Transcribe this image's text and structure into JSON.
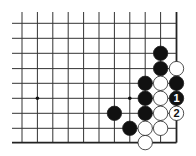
{
  "diagram": {
    "type": "go-board-corner",
    "view": "lower-right corner",
    "columns_x": [
      22,
      37.4,
      52.8,
      68.2,
      83.6,
      99,
      114.4,
      129.8,
      145.2,
      160.6,
      176.5
    ],
    "rows_y": [
      23.3,
      38.3,
      53.3,
      68.6,
      83.3,
      98.3,
      113.3,
      128.3,
      142.6
    ],
    "line_extent": {
      "left": 12,
      "top": 12,
      "right": 176.5,
      "bottom": 142.6
    },
    "edges": [
      "right",
      "bottom"
    ],
    "star_points": [
      {
        "col": 1,
        "row": 5
      },
      {
        "col": 7,
        "row": 5
      }
    ],
    "stones": [
      {
        "color": "black",
        "col": 9,
        "row": 2,
        "label": ""
      },
      {
        "color": "black",
        "col": 9,
        "row": 3,
        "label": ""
      },
      {
        "color": "white",
        "col": 10,
        "row": 3,
        "label": ""
      },
      {
        "color": "black",
        "col": 8,
        "row": 4,
        "label": ""
      },
      {
        "color": "white",
        "col": 9,
        "row": 4,
        "label": ""
      },
      {
        "color": "black",
        "col": 10,
        "row": 4,
        "label": ""
      },
      {
        "color": "black",
        "col": 8,
        "row": 5,
        "label": ""
      },
      {
        "color": "white",
        "col": 9,
        "row": 5,
        "label": ""
      },
      {
        "color": "black",
        "col": 10,
        "row": 5,
        "label": "1"
      },
      {
        "color": "black",
        "col": 6,
        "row": 6,
        "label": ""
      },
      {
        "color": "black",
        "col": 8,
        "row": 6,
        "label": ""
      },
      {
        "color": "white",
        "col": 9,
        "row": 6,
        "label": ""
      },
      {
        "color": "white",
        "col": 10,
        "row": 6,
        "label": "2"
      },
      {
        "color": "black",
        "col": 7,
        "row": 7,
        "label": ""
      },
      {
        "color": "white",
        "col": 8,
        "row": 7,
        "label": ""
      },
      {
        "color": "white",
        "col": 9,
        "row": 7,
        "label": ""
      },
      {
        "color": "white",
        "col": 8,
        "row": 8,
        "label": ""
      }
    ],
    "move_labels": [
      "1",
      "2"
    ],
    "colors": {
      "background": "#ffffff",
      "line": "#333333",
      "edge_line": "#222222",
      "black_stone": "#111111",
      "white_stone": "#ffffff",
      "stone_outline": "#222222"
    }
  }
}
